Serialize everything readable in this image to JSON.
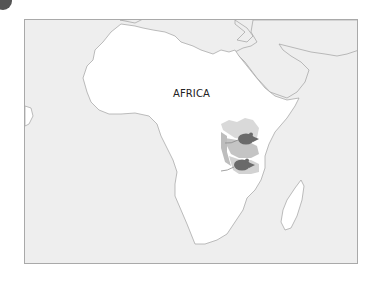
{
  "figure": {
    "corner_marker": "dark-circle-badge"
  },
  "map": {
    "title_label": "AFRICA",
    "colors": {
      "ocean": "#eeeeee",
      "land": "#ffffff",
      "coastline": "#a0a0a0",
      "frame_border": "#a9a9a9",
      "region_light": "#d9d9d9",
      "region_mid": "#c4c4c4",
      "region_dark": "#b0b0b0",
      "rodent": "#6a6a6a",
      "label": "#222222"
    },
    "features": [
      {
        "name": "africa",
        "type": "continent"
      },
      {
        "name": "arabian-peninsula",
        "type": "landmass"
      },
      {
        "name": "madagascar",
        "type": "island"
      },
      {
        "name": "europe-edge",
        "type": "landmass"
      },
      {
        "name": "east-africa-highlighted-region",
        "type": "highlighted-area"
      }
    ],
    "markers": [
      {
        "name": "rodent-north",
        "icon": "rodent-icon",
        "region": "north-east-africa"
      },
      {
        "name": "rodent-south",
        "icon": "rodent-icon",
        "region": "east-africa-coast"
      }
    ]
  }
}
